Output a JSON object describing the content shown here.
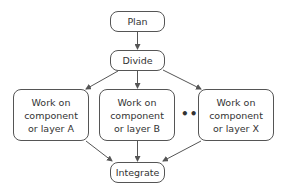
{
  "diagram": {
    "type": "flowchart",
    "nodes": {
      "plan": {
        "label": "Plan"
      },
      "divide": {
        "label": "Divide"
      },
      "work_a": {
        "label": "Work on component or layer A"
      },
      "work_b": {
        "label": "Work on component or layer B"
      },
      "work_x": {
        "label": "Work on component or layer X"
      },
      "integrate": {
        "label": "Integrate"
      }
    },
    "ellipsis": "•••",
    "edges": [
      {
        "from": "plan",
        "to": "divide"
      },
      {
        "from": "divide",
        "to": "work_a"
      },
      {
        "from": "divide",
        "to": "work_b"
      },
      {
        "from": "divide",
        "to": "work_x"
      },
      {
        "from": "work_a",
        "to": "integrate"
      },
      {
        "from": "work_b",
        "to": "integrate"
      },
      {
        "from": "work_x",
        "to": "integrate"
      }
    ],
    "colors": {
      "stroke": "#555555",
      "text": "#333333",
      "background": "#ffffff"
    }
  }
}
